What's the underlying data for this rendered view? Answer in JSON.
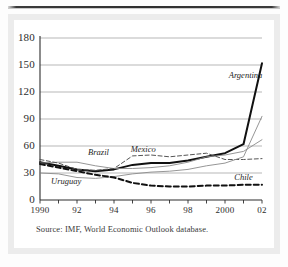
{
  "figure": {
    "source_note": "Source: IMF, World Economic Outlook database.",
    "colors": {
      "gridline": "#9a9a9a",
      "axis": "#2c2c2c",
      "argentina": "#111111",
      "brazil": "#111111",
      "mexico": "#555555",
      "uruguay": "#7a7a7a",
      "chile": "#111111",
      "card": "#ffffff",
      "frame": "#ececec"
    }
  },
  "chart_data": {
    "type": "line",
    "title": "",
    "subtitle": "",
    "xlabel": "",
    "ylabel": "",
    "xlim": [
      1990,
      2002
    ],
    "ylim": [
      0,
      180
    ],
    "grid": true,
    "legend_position": "inline-labels",
    "ytick_values": [
      0,
      30,
      60,
      90,
      120,
      150,
      180
    ],
    "ytick_labels": [
      "0",
      "30",
      "60",
      "90",
      "120",
      "150",
      "180"
    ],
    "xtick_values": [
      1990,
      1991,
      1992,
      1993,
      1994,
      1995,
      1996,
      1997,
      1998,
      1999,
      2000,
      2001,
      2002
    ],
    "xtick_labels": [
      "1990",
      "",
      "92",
      "",
      "94",
      "",
      "96",
      "",
      "98",
      "",
      "2000",
      "",
      "02"
    ],
    "x": [
      1990,
      1991,
      1992,
      1993,
      1994,
      1995,
      1996,
      1997,
      1998,
      1999,
      2000,
      2001,
      2002
    ],
    "series": [
      {
        "name": "Argentina",
        "style": "solid-thick",
        "color": "#111111",
        "label_x": 2000.2,
        "label_y": 138,
        "values": [
          42,
          38,
          34,
          32,
          34,
          39,
          41,
          41,
          44,
          48,
          52,
          62,
          152
        ]
      },
      {
        "name": "Brazil",
        "style": "solid-thin",
        "color": "#8a8a8a",
        "label_x": 1992.6,
        "label_y": 52,
        "values": [
          41,
          42,
          42,
          38,
          35,
          35,
          36,
          38,
          42,
          48,
          50,
          54,
          67
        ]
      },
      {
        "name": "Mexico",
        "style": "dashed-thin",
        "color": "#555555",
        "label_x": 1994.9,
        "label_y": 56,
        "values": [
          45,
          41,
          34,
          33,
          35,
          49,
          50,
          48,
          50,
          52,
          45,
          45,
          46
        ]
      },
      {
        "name": "Uruguay",
        "style": "solid-thin",
        "color": "#8a8a8a",
        "label_x": 1990.6,
        "label_y": 20,
        "values": [
          30,
          29,
          25,
          24,
          26,
          29,
          31,
          32,
          34,
          38,
          41,
          48,
          93
        ]
      },
      {
        "name": "Chile",
        "style": "dashed-thick",
        "color": "#111111",
        "label_x": 2000.5,
        "label_y": 25,
        "values": [
          40,
          36,
          32,
          28,
          25,
          19,
          16,
          15,
          15,
          16,
          16,
          17,
          17
        ]
      }
    ]
  }
}
